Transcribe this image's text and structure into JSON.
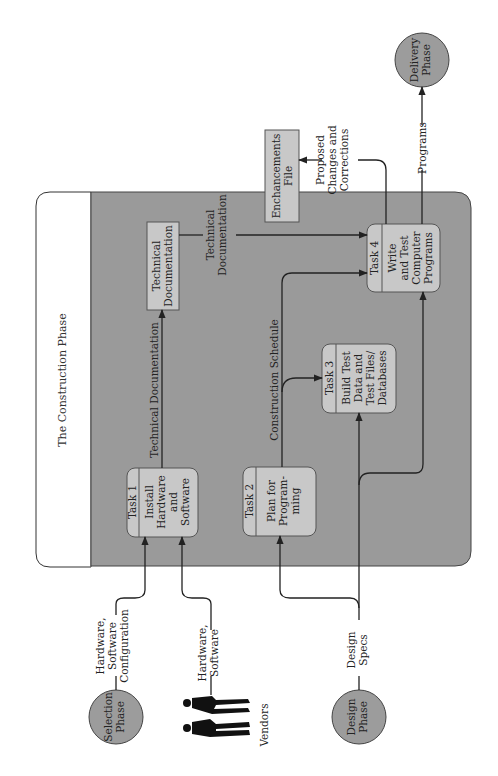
{
  "diagram": {
    "title": "The Construction Phase",
    "orientation": "rotated-90-ccw",
    "colors": {
      "panel": "#9a9a9a",
      "box": "#c8c8c8",
      "circle": "#9c9c9c",
      "line": "#222222",
      "background": "#ffffff"
    },
    "external_entities": {
      "selection_phase": {
        "line1": "Selection",
        "line2": "Phase"
      },
      "design_phase": {
        "line1": "Design",
        "line2": "Phase"
      },
      "delivery_phase": {
        "line1": "Delivery",
        "line2": "Phase"
      },
      "vendors": {
        "label": "Vendors"
      }
    },
    "tasks": [
      {
        "id": "Task 1",
        "lines": [
          "Install",
          "Hardware",
          "and",
          "Software"
        ]
      },
      {
        "id": "Task 2",
        "lines": [
          "Plan for",
          "Program-",
          "ming"
        ]
      },
      {
        "id": "Task 3",
        "lines": [
          "Build Test",
          "Data and",
          "Test Files/",
          "Databases"
        ]
      },
      {
        "id": "Task 4",
        "lines": [
          "Write",
          "and Test",
          "Computer",
          "Programs"
        ]
      }
    ],
    "data_stores": {
      "technical_documentation": {
        "lines": [
          "Technical",
          "Documentation"
        ]
      },
      "enhancements_file": {
        "lines": [
          "Enchancements",
          "File"
        ]
      }
    },
    "flows": {
      "hw_sw_config": {
        "lines": [
          "Hardware,",
          "Software",
          "Configuration"
        ]
      },
      "hw_sw": {
        "lines": [
          "Hardware,",
          "Software"
        ]
      },
      "design_specs": {
        "lines": [
          "Design",
          "Specs"
        ]
      },
      "tech_doc_1": {
        "label": "Technical Documentation"
      },
      "tech_doc_2": {
        "lines": [
          "Technical",
          "Documentation"
        ]
      },
      "construction_schedule": {
        "label": "Construction Schedule"
      },
      "proposed_changes": {
        "lines": [
          "Proposed",
          "Changes and",
          "Corrections"
        ]
      },
      "programs": {
        "label": "Programs"
      }
    }
  }
}
